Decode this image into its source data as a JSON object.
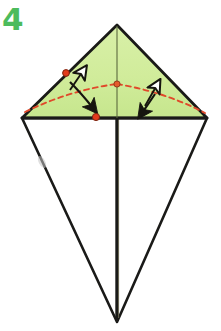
{
  "figure": {
    "step_label": "4",
    "step_label_color": "#4cbb5c",
    "background_color": "#ffffff"
  },
  "colors": {
    "paper_green": "#d2ed9e",
    "paper_green_shade": "#c6e68e",
    "paper_white": "#ffffff",
    "outline_black": "#1a1a18",
    "crease_red": "#e0492a",
    "dot_red": "#e23b1c",
    "dot_outline": "#8a2a12",
    "smudge_gray": "#b9b9b9"
  },
  "shapes": {
    "kite_top_apex": "117,25",
    "kite_left_corner": "22,118",
    "kite_right_corner": "207,118",
    "kite_bottom_tip": "117,322",
    "green_triangle_points": "117,25 207,118 22,118",
    "white_lower_points": "22,118 207,118 117,322",
    "center_vertical_top": "117,25",
    "center_vertical_bottom": "117,322"
  },
  "markers": {
    "dot_left": {
      "cx": 66,
      "cy": 73,
      "r": 3.4
    },
    "dot_center": {
      "cx": 117,
      "cy": 84,
      "r": 3.2
    },
    "dot_lower": {
      "cx": 96,
      "cy": 117,
      "r": 3.6
    }
  },
  "crease": {
    "style": "dashed",
    "dasharray": "5,4",
    "left_arc": "M 25,112 Q 70,90 117,84",
    "right_arc": "M 117,84 Q 165,92 205,113"
  },
  "arrows": [
    {
      "name": "hollow-arrow-left",
      "style": "outline",
      "path": "M 70,88 L 84,70"
    },
    {
      "name": "solid-arrow-left",
      "style": "solid",
      "path": "M 70,80 Q 82,92 95,110"
    },
    {
      "name": "hollow-arrow-right",
      "style": "outline",
      "path": "M 144,104 L 158,84"
    },
    {
      "name": "solid-arrow-right",
      "style": "solid",
      "path": "M 156,92 Q 150,102 141,114"
    }
  ],
  "smudge": {
    "x": 40,
    "y": 160,
    "w": 6,
    "h": 12
  }
}
